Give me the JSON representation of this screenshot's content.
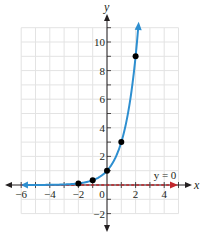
{
  "chart_data": {
    "type": "line",
    "title": "",
    "function": "y = 3^x",
    "xlabel": "x",
    "ylabel": "y",
    "xlim": [
      -6,
      5
    ],
    "ylim": [
      -2,
      11
    ],
    "grid": true,
    "x_ticks": [
      -6,
      -4,
      -2,
      0,
      2,
      4
    ],
    "y_ticks": [
      -2,
      2,
      4,
      6,
      8,
      10
    ],
    "x_tick_labels": [
      "−6",
      "−4",
      "−2",
      "0",
      "2",
      "4"
    ],
    "y_tick_labels": [
      "−2",
      "2",
      "4",
      "6",
      "8",
      "10"
    ],
    "series": [
      {
        "name": "y = 3^x",
        "color": "#2e8fd0",
        "points": [
          {
            "x": -2,
            "y": 0.111
          },
          {
            "x": -1,
            "y": 0.333
          },
          {
            "x": 0,
            "y": 1
          },
          {
            "x": 1,
            "y": 3
          },
          {
            "x": 2,
            "y": 9
          }
        ]
      }
    ],
    "asymptote": {
      "label": "y = 0",
      "color": "#c1272d",
      "style": "dashed"
    }
  },
  "colors": {
    "curve": "#2e8fd0",
    "asymptote": "#c1272d",
    "axis": "#231f20",
    "grid": "#e3e3e3"
  }
}
